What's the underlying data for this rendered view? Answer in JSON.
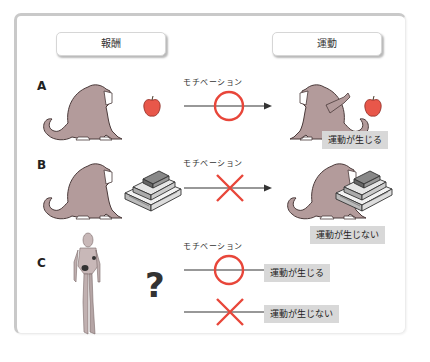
{
  "headers": {
    "reward": "報酬",
    "movement": "運動"
  },
  "motivation_label": "モチベーション",
  "colors": {
    "circle": "#e8463a",
    "cross": "#e8463a",
    "result_bg": "#d8d8d8",
    "monkey": "#b39b9b",
    "apple": "#e8574a"
  },
  "rows": [
    {
      "label": "A",
      "reward_icon": "apple-icon",
      "motivation_mark": "circle",
      "result": "運動が生じる"
    },
    {
      "label": "B",
      "reward_icon": "money-stack-icon",
      "motivation_mark": "cross",
      "result": "運動が生じない"
    },
    {
      "label": "C",
      "subject_icon": "humanoid-robot-icon",
      "question": "?",
      "outcomes": [
        {
          "motivation_mark": "circle",
          "result": "運動が生じる"
        },
        {
          "motivation_mark": "cross",
          "result": "運動が生じない"
        }
      ]
    }
  ]
}
